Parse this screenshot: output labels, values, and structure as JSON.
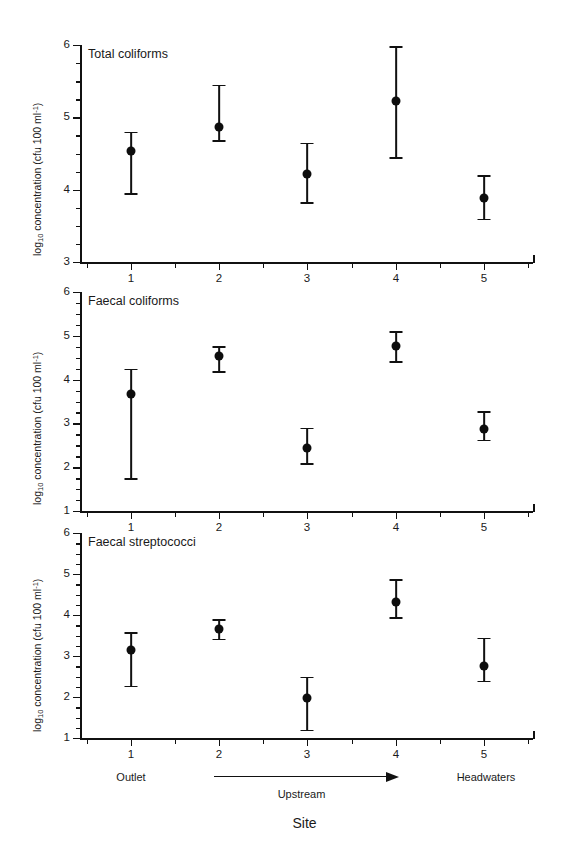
{
  "figure": {
    "background": "#ffffff",
    "ink_color": "#111111"
  },
  "axis": {
    "x_title": "Site",
    "y_title_prefix": "log",
    "y_title_sub": "10",
    "y_title_mid": " concentration (cfu 100 ml",
    "y_title_sup": "-1",
    "y_title_suffix": ")",
    "site_labels": [
      "1",
      "2",
      "3",
      "4",
      "5"
    ],
    "left_annotation": "Outlet",
    "center_annotation": "Upstream",
    "right_annotation": "Headwaters"
  },
  "chart_data": [
    {
      "type": "scatter",
      "title": "Total coliforms",
      "xlabel": "Site",
      "ylabel": "log10 concentration (cfu 100 ml-1)",
      "categories": [
        "1",
        "2",
        "3",
        "4",
        "5"
      ],
      "values": [
        4.53,
        4.87,
        4.22,
        5.22,
        3.88
      ],
      "err_low": [
        3.95,
        4.68,
        3.83,
        4.45,
        3.6
      ],
      "err_high": [
        4.8,
        5.45,
        4.65,
        5.98,
        4.2
      ],
      "ylim": [
        3,
        6
      ],
      "yticks": [
        3,
        4,
        5,
        6
      ],
      "ytick_labels": [
        "3",
        "4",
        "5",
        "6"
      ],
      "minor_tick_step": 0.25,
      "grid": false,
      "legend": null
    },
    {
      "type": "scatter",
      "title": "Faecal coliforms",
      "xlabel": "Site",
      "ylabel": "log10 concentration (cfu 100 ml-1)",
      "categories": [
        "1",
        "2",
        "3",
        "4",
        "5"
      ],
      "values": [
        3.67,
        4.53,
        2.43,
        4.77,
        2.88
      ],
      "err_low": [
        1.75,
        4.2,
        2.1,
        4.42,
        2.63
      ],
      "err_high": [
        4.25,
        4.77,
        2.9,
        5.1,
        3.28
      ],
      "ylim": [
        1,
        6
      ],
      "yticks": [
        1,
        2,
        3,
        4,
        5,
        6
      ],
      "ytick_labels": [
        "1",
        "2",
        "3",
        "4",
        "5",
        "6"
      ],
      "minor_tick_step": 0.25,
      "grid": false,
      "legend": null
    },
    {
      "type": "scatter",
      "title": "Faecal streptococci",
      "xlabel": "Site",
      "ylabel": "log10 concentration (cfu 100 ml-1)",
      "categories": [
        "1",
        "2",
        "3",
        "4",
        "5"
      ],
      "values": [
        3.15,
        3.67,
        1.97,
        4.32,
        2.75
      ],
      "err_low": [
        2.28,
        3.42,
        1.2,
        3.95,
        2.4
      ],
      "err_high": [
        3.58,
        3.9,
        2.5,
        4.87,
        3.45
      ],
      "ylim": [
        1,
        6
      ],
      "yticks": [
        1,
        2,
        3,
        4,
        5,
        6
      ],
      "ytick_labels": [
        "1",
        "2",
        "3",
        "4",
        "5",
        "6"
      ],
      "minor_tick_step": 0.25,
      "grid": false,
      "legend": null
    }
  ]
}
